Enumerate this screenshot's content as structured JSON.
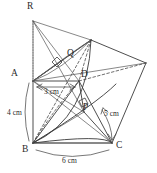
{
  "figure": {
    "type": "geometry-diagram",
    "vertices": [
      {
        "id": "R",
        "label": "R",
        "x": 27,
        "y": 7,
        "dot_x": 33,
        "dot_y": 21
      },
      {
        "id": "A",
        "label": "A",
        "x": 11,
        "y": 74,
        "dot_x": 33,
        "dot_y": 81
      },
      {
        "id": "B",
        "label": "B",
        "x": 22,
        "y": 146,
        "dot_x": 33,
        "dot_y": 143
      },
      {
        "id": "C",
        "label": "C",
        "x": 116,
        "y": 143,
        "dot_x": 112,
        "dot_y": 143
      },
      {
        "id": "D",
        "label": "D",
        "x": 81,
        "y": 74,
        "dot_x": 79,
        "dot_y": 81
      },
      {
        "id": "P",
        "label": "P",
        "x": 83,
        "y": 107,
        "dot_x": 84,
        "dot_y": 112
      },
      {
        "id": "Q",
        "label": "Q",
        "x": 67,
        "y": 53,
        "dot_x": 63,
        "dot_y": 60
      }
    ],
    "dimensions": [
      {
        "id": "ad",
        "label": "3 cm",
        "x": 41,
        "y": 87
      },
      {
        "id": "ab",
        "label": "4 cm",
        "x": 10,
        "y": 109
      },
      {
        "id": "bc",
        "label": "6 cm",
        "x": 64,
        "y": 157
      },
      {
        "id": "dc",
        "label": "5 cm",
        "x": 104,
        "y": 111
      }
    ],
    "markers": [
      {
        "id": "right-angle-q",
        "kind": "right-angle"
      },
      {
        "id": "right-angle-p",
        "kind": "right-angle"
      }
    ],
    "colors": {
      "stroke": "#3a3a3a",
      "hidden_stroke": "#4a4a4a",
      "background": "#ffffff",
      "text": "#2b2b2b"
    }
  }
}
